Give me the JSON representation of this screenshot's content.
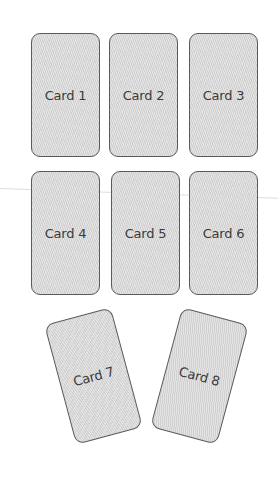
{
  "colors": {
    "background": "#ffffff",
    "card_fill": "#d9d9d9",
    "card_border": "#5a5a5a",
    "card_text": "#3a3a3a"
  },
  "cards": [
    {
      "label": "Card 1",
      "x": 31,
      "y": 33,
      "rotation": 0
    },
    {
      "label": "Card 2",
      "x": 109,
      "y": 33,
      "rotation": 0
    },
    {
      "label": "Card 3",
      "x": 189,
      "y": 33,
      "rotation": 0
    },
    {
      "label": "Card 4",
      "x": 31,
      "y": 171,
      "rotation": 0
    },
    {
      "label": "Card 5",
      "x": 111,
      "y": 171,
      "rotation": 0
    },
    {
      "label": "Card 6",
      "x": 189,
      "y": 171,
      "rotation": 0
    },
    {
      "label": "Card 7",
      "x": 59,
      "y": 314,
      "rotation": -15
    },
    {
      "label": "Card 8",
      "x": 165,
      "y": 314,
      "rotation": 15
    }
  ]
}
